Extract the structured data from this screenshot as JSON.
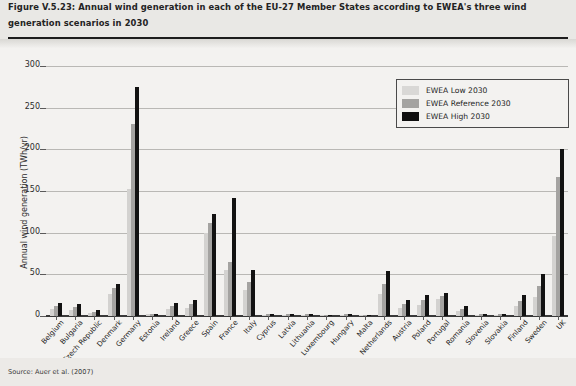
{
  "figure": {
    "title": "Figure V.5.23: Annual wind generation in each of the EU-27 Member States according to EWEA's three wind generation scenarios in 2030",
    "source": "Source: Auer et al. (2007)"
  },
  "legend": {
    "position": "top-right",
    "entries": [
      {
        "label": "EWEA Low 2030",
        "color": "#d9d8d6",
        "key": "low"
      },
      {
        "label": "EWEA Reference 2030",
        "color": "#a4a3a1",
        "key": "ref"
      },
      {
        "label": "EWEA High 2030",
        "color": "#0f0f0f",
        "key": "high"
      }
    ]
  },
  "axes": {
    "ylabel": "Annual wind generation (TWh/yr)",
    "yticks": [
      0,
      50,
      100,
      150,
      200,
      250,
      300
    ],
    "ylim": [
      0,
      300
    ],
    "xlabel": "",
    "grid": true
  },
  "chart_data": {
    "type": "bar",
    "title": "Figure V.5.23: Annual wind generation in each of the EU-27 Member States according to EWEA's three wind generation scenarios in 2030",
    "xlabel": "",
    "ylabel": "Annual wind generation (TWh/yr)",
    "ylim": [
      0,
      300
    ],
    "yticks": [
      0,
      50,
      100,
      150,
      200,
      250,
      300
    ],
    "grid": true,
    "legend_position": "top-right",
    "categories": [
      "Belgium",
      "Bulgaria",
      "Czech Republic",
      "Denmark",
      "Germany",
      "Estonia",
      "Ireland",
      "Greece",
      "Spain",
      "France",
      "Italy",
      "Cyprus",
      "Latvia",
      "Lithuania",
      "Luxembourg",
      "Hungary",
      "Malta",
      "Netherlands",
      "Austria",
      "Poland",
      "Portugal",
      "Romania",
      "Slovenia",
      "Slovakia",
      "Finland",
      "Sweden",
      "UK"
    ],
    "series": [
      {
        "name": "EWEA Low 2030",
        "color": "#d9d8d6",
        "values": [
          9,
          7,
          4,
          26,
          152,
          2,
          9,
          10,
          100,
          55,
          31,
          1,
          1,
          1,
          0,
          1,
          0,
          27,
          10,
          13,
          20,
          6,
          1,
          1,
          12,
          23,
          96
        ]
      },
      {
        "name": "EWEA Reference 2030",
        "color": "#a4a3a1",
        "values": [
          12,
          11,
          5,
          34,
          230,
          2,
          12,
          14,
          112,
          65,
          41,
          2,
          2,
          2,
          1,
          2,
          0,
          38,
          15,
          19,
          24,
          9,
          2,
          2,
          18,
          36,
          167
        ]
      },
      {
        "name": "EWEA High 2030",
        "color": "#0f0f0f",
        "values": [
          16,
          15,
          7,
          39,
          275,
          3,
          16,
          19,
          122,
          142,
          55,
          3,
          3,
          3,
          1,
          3,
          1,
          54,
          19,
          25,
          28,
          12,
          3,
          3,
          25,
          50,
          200
        ]
      }
    ]
  }
}
